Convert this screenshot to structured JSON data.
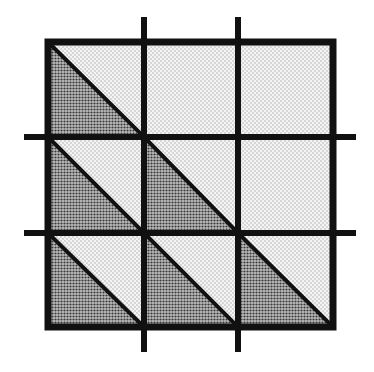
{
  "diagram": {
    "type": "grid-triangles",
    "grid": {
      "rows": 3,
      "cols": 3,
      "outer_square": {
        "x": 48,
        "y": 42,
        "size": 285
      },
      "vertical_lines_x": [
        144,
        238
      ],
      "horizontal_lines_y": [
        137,
        233
      ],
      "line_extension": {
        "top": 17,
        "bottom": 352,
        "left": 24,
        "right": 356
      }
    },
    "diagonals": [
      {
        "from": [
          48,
          42
        ],
        "to": [
          144,
          137
        ]
      },
      {
        "from": [
          48,
          137
        ],
        "to": [
          238,
          327
        ]
      },
      {
        "from": [
          48,
          233
        ],
        "to": [
          144,
          327
        ]
      },
      {
        "from": [
          144,
          137
        ],
        "to": [
          238,
          233
        ]
      },
      {
        "from": [
          238,
          233
        ],
        "to": [
          333,
          327
        ]
      }
    ],
    "dark_triangles": [
      {
        "cell": "r1c1",
        "points": [
          [
            48,
            42
          ],
          [
            48,
            137
          ],
          [
            144,
            137
          ]
        ]
      },
      {
        "cell": "r2c1",
        "points": [
          [
            48,
            137
          ],
          [
            48,
            233
          ],
          [
            144,
            233
          ]
        ]
      },
      {
        "cell": "r2c2",
        "points": [
          [
            144,
            137
          ],
          [
            144,
            233
          ],
          [
            238,
            233
          ]
        ]
      },
      {
        "cell": "r3c1",
        "points": [
          [
            48,
            233
          ],
          [
            48,
            327
          ],
          [
            144,
            327
          ]
        ]
      },
      {
        "cell": "r3c2",
        "points": [
          [
            144,
            233
          ],
          [
            144,
            327
          ],
          [
            238,
            327
          ]
        ]
      },
      {
        "cell": "r3c3",
        "points": [
          [
            238,
            233
          ],
          [
            238,
            327
          ],
          [
            333,
            327
          ]
        ]
      }
    ],
    "colors": {
      "line": "#111111",
      "light_fill": "#e6e6e6",
      "dark_fill": "#8c8c8c",
      "background": "#ffffff"
    }
  }
}
